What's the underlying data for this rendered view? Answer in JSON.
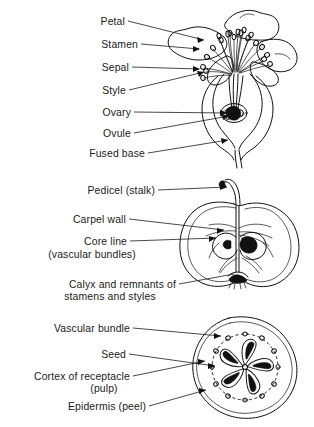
{
  "figure": {
    "background_color": "#ffffff",
    "ink_color": "#111111",
    "panels": [
      {
        "id": "flower",
        "name": "apple-flower-longitudinal-section",
        "labels": [
          {
            "text": "Petal"
          },
          {
            "text": "Stamen"
          },
          {
            "text": "Sepal"
          },
          {
            "text": "Style"
          },
          {
            "text": "Ovary"
          },
          {
            "text": "Ovule"
          },
          {
            "text": "Fused base"
          }
        ]
      },
      {
        "id": "fruit-longitudinal",
        "name": "apple-longitudinal-section",
        "labels": [
          {
            "text": "Pedicel (stalk)"
          },
          {
            "text": "Carpel wall"
          },
          {
            "text": "Core line",
            "text2": "(vascular bundles)"
          },
          {
            "text": "Calyx and remnants of",
            "text2": "stamens and styles"
          }
        ]
      },
      {
        "id": "fruit-transverse",
        "name": "apple-transverse-section",
        "labels": [
          {
            "text": "Vascular bundle"
          },
          {
            "text": "Seed"
          },
          {
            "text": "Cortex of receptacle",
            "text2": "(pulp)"
          },
          {
            "text": "Epidermis (peel)"
          }
        ]
      }
    ]
  },
  "labels": {
    "petal": "Petal",
    "stamen": "Stamen",
    "sepal": "Sepal",
    "style": "Style",
    "ovary": "Ovary",
    "ovule": "Ovule",
    "fused_base": "Fused base",
    "pedicel": "Pedicel (stalk)",
    "carpel_wall": "Carpel wall",
    "core_line": "Core line",
    "core_line_2": "(vascular bundles)",
    "calyx": "Calyx and remnants of",
    "calyx_2": "stamens and styles",
    "vascular_bundle": "Vascular bundle",
    "seed": "Seed",
    "cortex": "Cortex of receptacle",
    "cortex_2": "(pulp)",
    "epidermis": "Epidermis (peel)"
  }
}
